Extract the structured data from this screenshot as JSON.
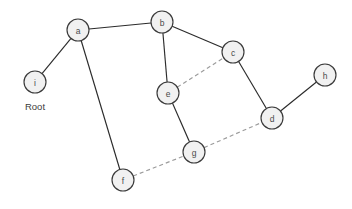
{
  "diagram": {
    "width": 352,
    "height": 209,
    "background_color": "#ffffff",
    "node_radius": 11,
    "node_fill_color": "#f1f1f1",
    "node_stroke_color": "#3a3a3a",
    "solid_edge_color": "#2b2b2b",
    "dashed_edge_color": "#9b9b9b",
    "nodes": [
      {
        "id": "a",
        "label": "a",
        "x": 78,
        "y": 30
      },
      {
        "id": "b",
        "label": "b",
        "x": 162,
        "y": 22
      },
      {
        "id": "c",
        "label": "c",
        "x": 233,
        "y": 52
      },
      {
        "id": "d",
        "label": "d",
        "x": 272,
        "y": 118
      },
      {
        "id": "e",
        "label": "e",
        "x": 168,
        "y": 93
      },
      {
        "id": "f",
        "label": "f",
        "x": 123,
        "y": 180
      },
      {
        "id": "g",
        "label": "g",
        "x": 194,
        "y": 152
      },
      {
        "id": "h",
        "label": "h",
        "x": 325,
        "y": 75
      },
      {
        "id": "i",
        "label": "i",
        "x": 35,
        "y": 82
      }
    ],
    "edges": [
      {
        "source": "a",
        "target": "i",
        "style": "solid"
      },
      {
        "source": "a",
        "target": "b",
        "style": "solid"
      },
      {
        "source": "a",
        "target": "f",
        "style": "solid"
      },
      {
        "source": "b",
        "target": "c",
        "style": "solid"
      },
      {
        "source": "b",
        "target": "e",
        "style": "solid"
      },
      {
        "source": "c",
        "target": "d",
        "style": "solid"
      },
      {
        "source": "d",
        "target": "h",
        "style": "solid"
      },
      {
        "source": "e",
        "target": "g",
        "style": "solid"
      },
      {
        "source": "e",
        "target": "c",
        "style": "dashed"
      },
      {
        "source": "g",
        "target": "d",
        "style": "dashed"
      },
      {
        "source": "f",
        "target": "g",
        "style": "dashed"
      }
    ],
    "annotations": [
      {
        "id": "root",
        "text": "Root",
        "x": 35,
        "y": 106
      }
    ]
  }
}
